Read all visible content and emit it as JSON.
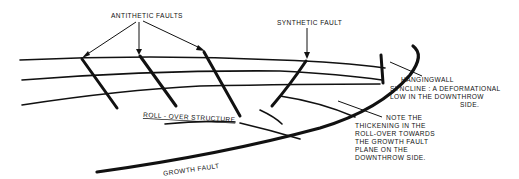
{
  "diagram": {
    "labels": {
      "antithetic_faults": "ANTITHETIC FAULTS",
      "synthetic_fault": "SYNTHETIC FAULT",
      "roll_over_structure": "ROLL - OVER STRUCTURE",
      "growth_fault": "GROWTH FAULT",
      "hangingwall_lines": [
        "HANGINGWALL",
        "SYNCLINE : A DEFORMATIONAL",
        "LOW IN THE DOWNTHROW",
        "SIDE."
      ],
      "note_lines": [
        "NOTE THE",
        "THICKENING IN THE",
        "ROLL-OVER TOWARDS",
        "THE GROWTH FAULT",
        "PLANE ON THE",
        "DOWNTHROW SIDE."
      ]
    },
    "colors": {
      "ink": "#111111",
      "background": "#ffffff"
    }
  }
}
